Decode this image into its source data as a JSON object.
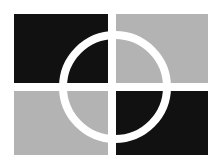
{
  "canvas": {
    "width": 220,
    "height": 167,
    "background_color": "#ffffff",
    "alt_text": "Abstract logo: four-quadrant square with white cross gap and white circle outline"
  },
  "palette": {
    "black": "#111111",
    "gray": "#b3b3b3",
    "white": "#ffffff"
  },
  "graphic": {
    "name": "quadrant-circle-logo",
    "block": {
      "x": 14,
      "y": 14,
      "width": 194,
      "height": 141
    },
    "cross_gap": {
      "center_x": 112,
      "center_y": 87,
      "thickness": 8,
      "color": "#ffffff"
    },
    "quadrants": [
      {
        "name": "top-left",
        "color": "#111111",
        "x": 14,
        "y": 14,
        "width": 94,
        "height": 69
      },
      {
        "name": "top-right",
        "color": "#b3b3b3",
        "x": 116,
        "y": 14,
        "width": 92,
        "height": 69
      },
      {
        "name": "bottom-left",
        "color": "#b3b3b3",
        "x": 14,
        "y": 91,
        "width": 94,
        "height": 64
      },
      {
        "name": "bottom-right",
        "color": "#111111",
        "x": 116,
        "y": 91,
        "width": 92,
        "height": 64
      }
    ],
    "ring": {
      "center_x": 115,
      "center_y": 87,
      "radius": 52,
      "stroke_width": 8,
      "stroke_color": "#ffffff"
    }
  }
}
